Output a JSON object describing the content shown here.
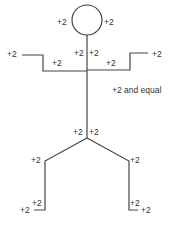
{
  "diagram": {
    "type": "stick-figure-labeled",
    "line_color": "#444444",
    "text_color": "#333333",
    "labels": {
      "head_left": "+2",
      "head_right": "+2",
      "neck_left": "+2",
      "neck_right": "+2",
      "left_hand": "+2",
      "left_upper_arm": "+2",
      "right_hand": "+2",
      "right_upper_arm": "+2",
      "torso_note": "+2 and equal",
      "hip_left": "+2",
      "hip_right": "+2",
      "left_knee": "+2",
      "right_knee": "+2",
      "left_ankle": "+2",
      "left_toe": "+2",
      "right_ankle": "+2",
      "right_toe": "+2"
    }
  }
}
